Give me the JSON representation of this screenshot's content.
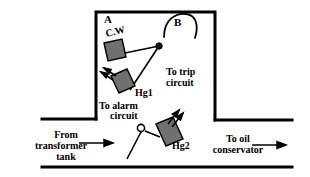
{
  "figure": {
    "background_color": "#ffffff",
    "line_color": "#000000",
    "float_fill_color": "#707070",
    "float_stroke_color": "#000000"
  },
  "labels": {
    "chamber_a": "A",
    "chamber_b": "B",
    "counter_weight": "C.W",
    "mercury_switch_1": "Hg1",
    "mercury_switch_2": "Hg2",
    "alarm_circuit_line1": "To alarm",
    "alarm_circuit_line2": "circuit",
    "trip_circuit_line1": "To trip",
    "trip_circuit_line2": "circuit",
    "from_tank_line1": "From",
    "from_tank_line2": "transformer",
    "from_tank_line3": "tank",
    "to_conservator_line1": "To oil",
    "to_conservator_line2": "conservator"
  },
  "flow": {
    "inlet_arrow": "arrow-right",
    "outlet_arrow": "arrow-right"
  },
  "components": {
    "pivot_upper": "filled-pivot-dot",
    "pivot_lower": "hollow-pivot-circle",
    "gas_arrows_upper": "double-arrow-up-left",
    "gas_arrows_lower": "double-arrow-up-right"
  }
}
